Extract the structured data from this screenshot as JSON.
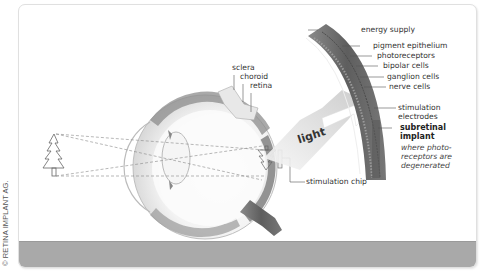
{
  "credit": "© RETINA IMPLANT AG.",
  "eye_labels": {
    "sclera": "sclera",
    "choroid": "choroid",
    "retina": "retina",
    "stimulation_chip": "stimulation chip"
  },
  "arrow_label": "light",
  "retina_layers": {
    "energy_supply": "energy supply",
    "pigment_epithelium": "pigment epithelium",
    "photoreceptors": "photoreceptors",
    "bipolar_cells": "bipolar cells",
    "ganglion_cells": "ganglion cells",
    "nerve_cells": "nerve cells",
    "stimulation_electrodes_1": "stimulation",
    "stimulation_electrodes_2": "electrodes",
    "subretinal_implant_1": "subretinal",
    "subretinal_implant_2": "implant",
    "note_1": "where photo-",
    "note_2": "receptors are",
    "note_3": "degenerated"
  },
  "colors": {
    "background": "#ffffff",
    "band": "#a9a9a9",
    "line": "#555555",
    "retina_tissue": "#6e6e6e"
  }
}
